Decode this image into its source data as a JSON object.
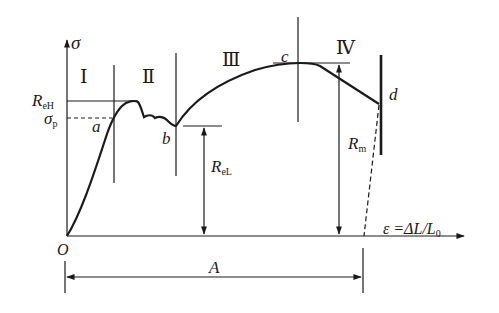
{
  "diagram": {
    "type": "stress-strain curve",
    "axes": {
      "y_label": "σ",
      "x_label": "ε =ΔL/L",
      "x_label_sub": "0",
      "origin": "O"
    },
    "regions": [
      "Ⅰ",
      "Ⅱ",
      "Ⅲ",
      "Ⅳ"
    ],
    "points": {
      "a": "a",
      "b": "b",
      "c": "c",
      "d": "d"
    },
    "levels": {
      "reh_main": "R",
      "reh_sub": "eH",
      "sigma_p_main": "σ",
      "sigma_p_sub": "p",
      "rel_main": "R",
      "rel_sub": "eL",
      "rm_main": "R",
      "rm_sub": "m"
    },
    "dimension": {
      "label": "A"
    },
    "colors": {
      "line": "#1a1a1a",
      "background": "#ffffff"
    }
  }
}
